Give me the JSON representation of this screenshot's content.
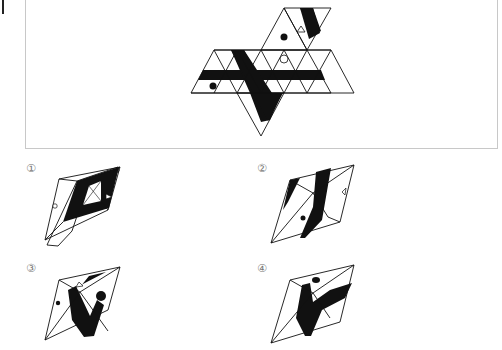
{
  "question": {
    "frame_title": "",
    "net": {
      "description": "Unfolded net of an octahedron-like solid composed of equilateral triangles with black stripes, a filled dot, an open circle, a small triangle symbol and a black wedge",
      "symbols": [
        "filled-dot",
        "open-triangle",
        "open-circle",
        "filled-dot",
        "black-stripe",
        "black-wedge"
      ]
    }
  },
  "options": [
    {
      "label": "①",
      "id": "1",
      "features": [
        "black-ring",
        "open-triangle",
        "open-circle"
      ]
    },
    {
      "label": "②",
      "id": "2",
      "features": [
        "black-stripes",
        "open-triangle",
        "filled-dot"
      ]
    },
    {
      "label": "③",
      "id": "3",
      "features": [
        "black-v",
        "open-triangle",
        "filled-dot-small",
        "filled-dot-large"
      ]
    },
    {
      "label": "④",
      "id": "4",
      "features": [
        "black-v",
        "filled-oval-dot"
      ]
    }
  ],
  "colors": {
    "ink": "#111111",
    "frame": "#c8c8c8",
    "label": "#777777"
  }
}
